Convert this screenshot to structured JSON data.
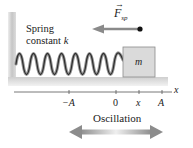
{
  "diagram": {
    "force_label": "F",
    "force_subscript": "sp",
    "spring_label_line1": "Spring",
    "spring_label_line2": "constant",
    "spring_label_var": "k",
    "mass_label": "m",
    "axis": {
      "variable": "x",
      "ticks": [
        {
          "label": "−A",
          "x": 69
        },
        {
          "label": "0",
          "x": 116
        },
        {
          "label": "x",
          "x": 139
        },
        {
          "label": "A",
          "x": 162
        }
      ]
    },
    "oscillation_label": "Oscillation",
    "colors": {
      "wall": "#c8c8c8",
      "floor": "#d4d4d4",
      "spring": "#333333",
      "block": "#d9d9d9",
      "arrow": "#7a7a7a",
      "text": "#222222"
    }
  }
}
